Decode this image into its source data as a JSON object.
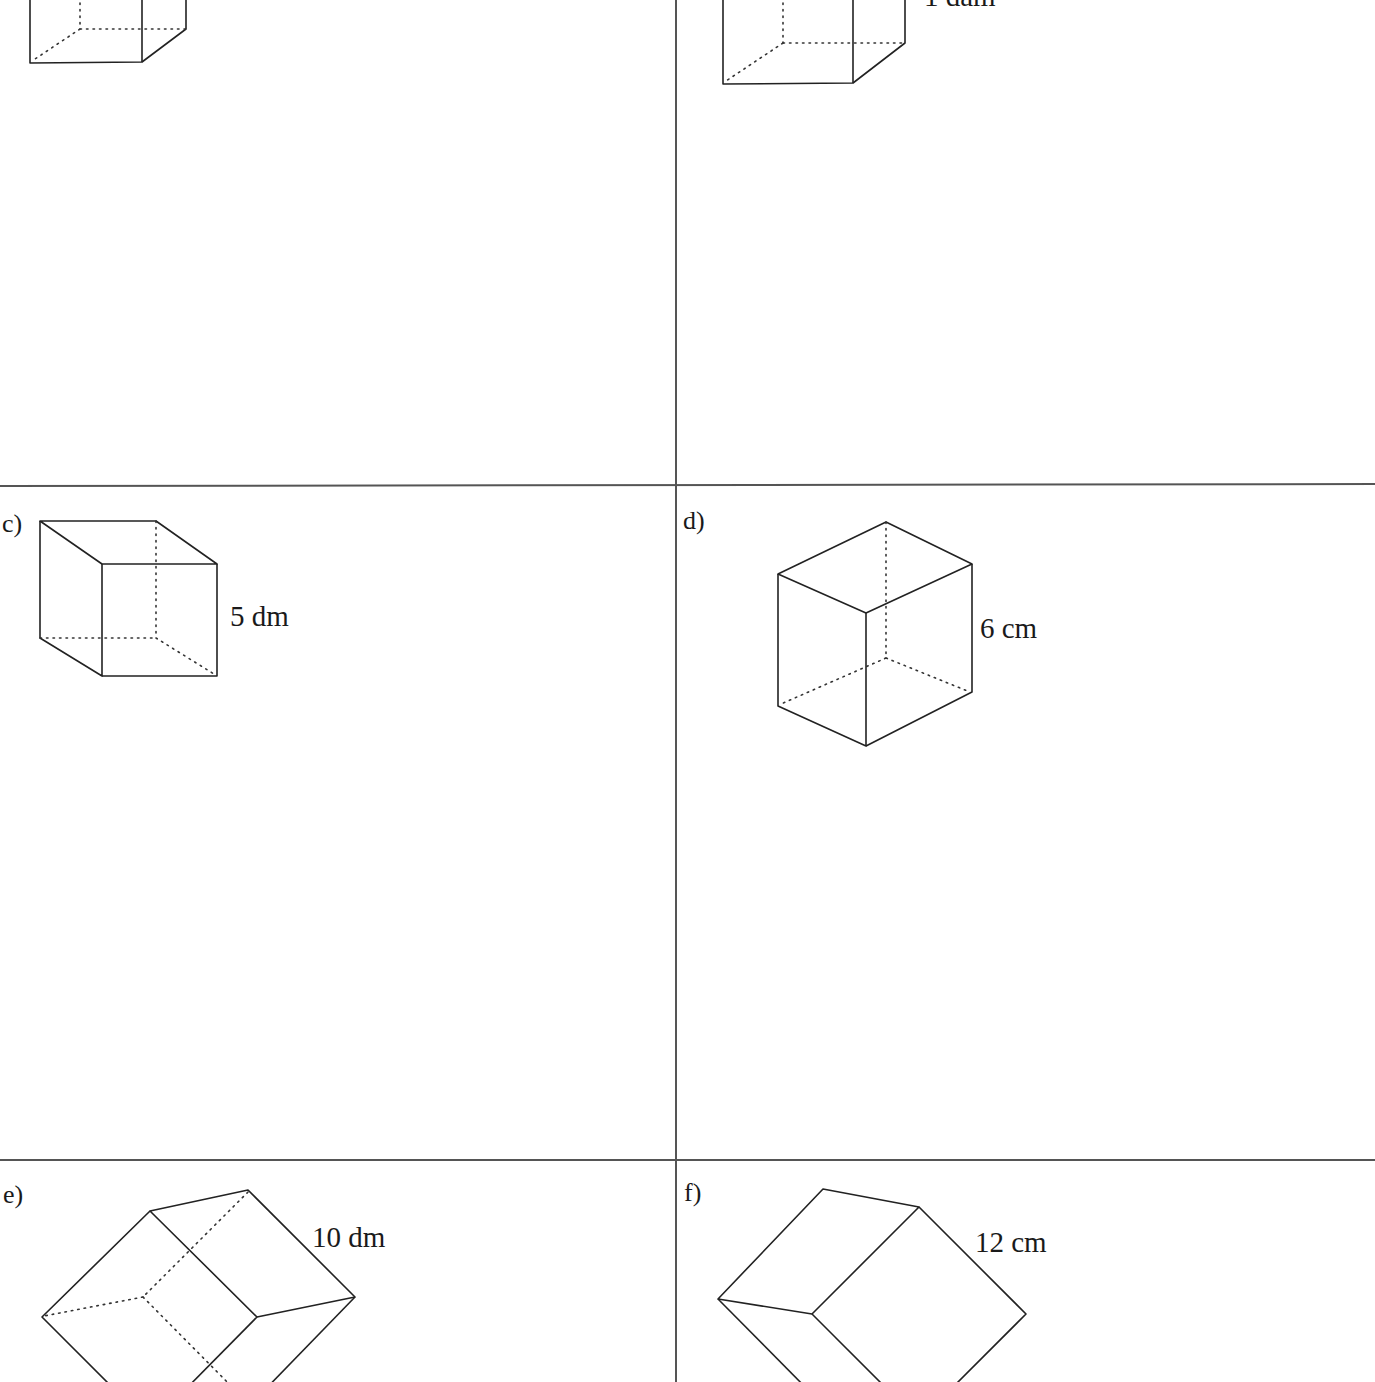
{
  "worksheet": {
    "panels": [
      {
        "id": "a",
        "label": "",
        "dimension": "",
        "shape": "cube",
        "note": "top portion cut off"
      },
      {
        "id": "b",
        "label": "",
        "dimension": "1 dam",
        "shape": "cube",
        "note": "top portion cut off"
      },
      {
        "id": "c",
        "label": "c)",
        "dimension": "5 dm",
        "shape": "cube"
      },
      {
        "id": "d",
        "label": "d)",
        "dimension": "6 cm",
        "shape": "cube"
      },
      {
        "id": "e",
        "label": "e)",
        "dimension": "10 dm",
        "shape": "cube"
      },
      {
        "id": "f",
        "label": "f)",
        "dimension": "12 cm",
        "shape": "cube"
      }
    ],
    "colors": {
      "background": "#ffffff",
      "line": "#222222",
      "grid": "#555555"
    }
  }
}
